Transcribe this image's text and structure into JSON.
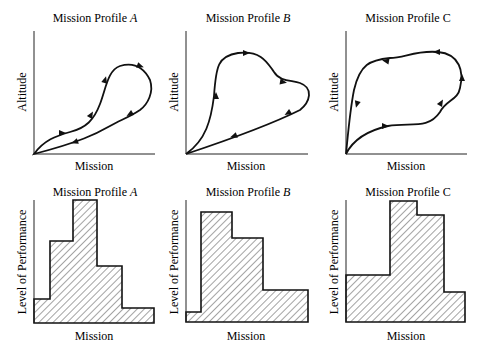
{
  "figure": {
    "top_row": [
      {
        "title_prefix": "Mission Profile ",
        "title_letter": "A",
        "letter_italic": true,
        "ylabel": "Altitude",
        "xlabel": "Mission"
      },
      {
        "title_prefix": "Mission Profile ",
        "title_letter": "B",
        "letter_italic": true,
        "ylabel": "Altitude",
        "xlabel": "Mission"
      },
      {
        "title_prefix": "Mission Profile ",
        "title_letter": "C",
        "letter_italic": false,
        "ylabel": "Altitude",
        "xlabel": "Mission"
      }
    ],
    "bottom_row": [
      {
        "title_prefix": "Mission Profile ",
        "title_letter": "A",
        "letter_italic": true,
        "ylabel": "Level of Performance",
        "xlabel": "Mission"
      },
      {
        "title_prefix": "Mission Profile ",
        "title_letter": "B",
        "letter_italic": true,
        "ylabel": "Level of Performance",
        "xlabel": "Mission"
      },
      {
        "title_prefix": "Mission Profile ",
        "title_letter": "C",
        "letter_italic": false,
        "ylabel": "Level of Performance",
        "xlabel": "Mission"
      }
    ]
  },
  "chart_data": [
    {
      "type": "line",
      "title": "Mission Profile A",
      "xlabel": "Mission",
      "ylabel": "Altitude",
      "description": "Closed clockwise loop from origin: rises gently, climbs steeply to a high peak near right, then descends back to origin along a lower path.",
      "path": "M34,154 C44,140 56,136 70,132 C86,128 94,120 100,104 C106,88 108,70 120,66 C134,62 144,68 150,80 C154,92 148,104 140,110 C128,118 120,120 110,126 C96,134 80,142 34,154 Z",
      "arrows": [
        [
          62,
          133,
          0
        ],
        [
          91,
          115,
          -60
        ],
        [
          105,
          80,
          -75
        ],
        [
          140,
          66,
          20
        ],
        [
          130,
          114,
          150
        ],
        [
          75,
          142,
          160
        ]
      ]
    },
    {
      "type": "line",
      "title": "Mission Profile B",
      "xlabel": "Mission",
      "ylabel": "Altitude",
      "description": "Closed loop: sharp vertical climb, high plateau with a dip, then a straight descent back to origin.",
      "path": "M186,154 C206,140 211,120 214,96 C216,66 218,56 238,53 C262,50 268,64 274,72 C280,82 292,80 300,83 C314,88 310,102 300,110 C280,120 240,136 186,154 Z",
      "arrows": [
        [
          216,
          96,
          -90
        ],
        [
          246,
          53,
          0
        ],
        [
          283,
          82,
          10
        ],
        [
          288,
          113,
          150
        ],
        [
          234,
          136,
          160
        ]
      ]
    },
    {
      "type": "line",
      "title": "Mission Profile C",
      "xlabel": "Mission",
      "ylabel": "Altitude",
      "description": "Closed counter-clockwise loop: gentle rise along bottom, climbs on right, high ceiling moving left, steep descent to origin.",
      "path": "M346,154 C354,138 370,130 388,126 C410,122 428,130 440,112 C446,100 458,100 460,88 C464,72 460,54 438,52 C416,50 404,58 390,58 C370,60 360,64 354,90 C350,110 348,134 346,154 Z",
      "arrows": [
        [
          385,
          126,
          0
        ],
        [
          441,
          103,
          -60
        ],
        [
          462,
          78,
          -90
        ],
        [
          437,
          52,
          180
        ],
        [
          386,
          61,
          190
        ],
        [
          357,
          104,
          105
        ]
      ]
    },
    {
      "type": "bar",
      "title": "Mission Profile A",
      "xlabel": "Mission",
      "ylabel": "Level of Performance",
      "categories": [
        "Phase 1",
        "Phase 2",
        "Phase 3",
        "Phase 4",
        "Phase 5"
      ],
      "values": [
        20,
        68,
        100,
        47,
        12
      ],
      "segments": [
        [
          34,
          50,
          299
        ],
        [
          50,
          73,
          241
        ],
        [
          73,
          97,
          200
        ],
        [
          97,
          122,
          266
        ],
        [
          122,
          154,
          308
        ]
      ],
      "baseline": 323
    },
    {
      "type": "bar",
      "title": "Mission Profile B",
      "xlabel": "Mission",
      "ylabel": "Level of Performance",
      "categories": [
        "Phase 1",
        "Phase 2",
        "Phase 3",
        "Phase 4"
      ],
      "values": [
        9,
        100,
        77,
        29
      ],
      "segments": [
        [
          186,
          201,
          312
        ],
        [
          201,
          232,
          212
        ],
        [
          232,
          263,
          238
        ],
        [
          263,
          308,
          290
        ]
      ],
      "baseline": 322
    },
    {
      "type": "bar",
      "title": "Mission Profile C",
      "xlabel": "Mission",
      "ylabel": "Level of Performance",
      "categories": [
        "Phase 1",
        "Phase 2",
        "Phase 3",
        "Phase 4"
      ],
      "values": [
        39,
        100,
        88,
        25
      ],
      "segments": [
        [
          346,
          390,
          275
        ],
        [
          390,
          417,
          201
        ],
        [
          417,
          444,
          215
        ],
        [
          444,
          465,
          292
        ]
      ],
      "baseline": 322
    }
  ]
}
